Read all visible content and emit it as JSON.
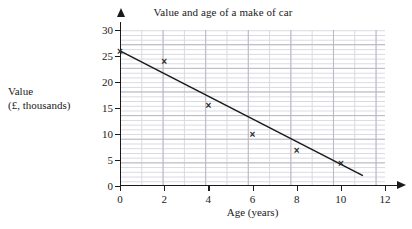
{
  "chart_data": {
    "type": "scatter",
    "title": "Value and age of a make of car",
    "xlabel": "Age (years)",
    "ylabel": "Value\n(£, thousands)",
    "ylabel_line1": "Value",
    "ylabel_line2": "(£, thousands)",
    "xlim": [
      0,
      12
    ],
    "ylim": [
      0,
      30
    ],
    "xticks": [
      0,
      2,
      4,
      6,
      8,
      10,
      12
    ],
    "yticks": [
      0,
      5,
      10,
      15,
      20,
      25,
      30
    ],
    "xtick_labels": [
      "0",
      "2",
      "4",
      "6",
      "8",
      "10",
      "12"
    ],
    "ytick_labels": [
      "0",
      "5",
      "10",
      "15",
      "20",
      "25",
      "30"
    ],
    "x_minor_step": 1,
    "y_minor_step": 1,
    "grid": true,
    "legend": false,
    "marker": "x",
    "x": [
      0,
      2,
      4,
      6,
      8,
      10
    ],
    "values": [
      26,
      24,
      15.5,
      10,
      7,
      4.5
    ],
    "points": [
      {
        "x": 0,
        "y": 26
      },
      {
        "x": 2,
        "y": 24
      },
      {
        "x": 4,
        "y": 15.5
      },
      {
        "x": 6,
        "y": 10
      },
      {
        "x": 8,
        "y": 7
      },
      {
        "x": 10,
        "y": 4.5
      }
    ],
    "series": [
      {
        "name": "Value of car",
        "values": [
          26,
          24,
          15.5,
          10,
          7,
          4.5
        ]
      }
    ],
    "trend_line": {
      "name": "line of best fit",
      "x_start": 0,
      "y_start": 26,
      "x_end": 11,
      "y_end": 2
    },
    "colors": {
      "axis": "#1a1a1a",
      "marker": "#2b2b2b",
      "trend_line": "#1a1a1a",
      "grid_major": "#b9b9c4",
      "grid_minor": "#d8d8e0",
      "background": "#ffffff"
    }
  }
}
